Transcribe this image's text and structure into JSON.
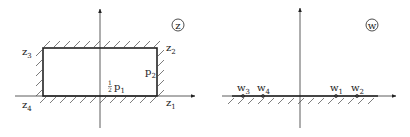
{
  "figure": {
    "left_panel": {
      "plane_label": "z",
      "rectangle": {
        "x1": 43,
        "y1": 48,
        "x2": 157,
        "y2": 96
      },
      "vertices": [
        {
          "name": "z",
          "sub": "1",
          "x": 166,
          "y": 106
        },
        {
          "name": "z",
          "sub": "2",
          "x": 166,
          "y": 50
        },
        {
          "name": "z",
          "sub": "3",
          "x": 23,
          "y": 54
        },
        {
          "name": "z",
          "sub": "4",
          "x": 23,
          "y": 108
        }
      ],
      "side_labels": {
        "p2": {
          "name": "p",
          "sub": "2",
          "x": 146,
          "y": 75
        },
        "half_p1": {
          "frac_num": "1",
          "frac_den": "2",
          "name": "p",
          "sub": "1",
          "x": 106,
          "y": 90
        }
      }
    },
    "right_panel": {
      "plane_label": "w",
      "points": [
        {
          "name": "w",
          "sub": "3",
          "x": 243
        },
        {
          "name": "w",
          "sub": "4",
          "x": 263
        },
        {
          "name": "w",
          "sub": "1",
          "x": 336
        },
        {
          "name": "w",
          "sub": "2",
          "x": 357
        }
      ]
    }
  }
}
